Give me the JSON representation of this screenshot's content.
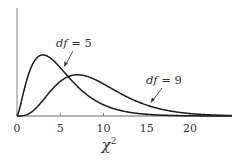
{
  "chart_data": {
    "type": "line",
    "title": "",
    "xlabel": "χ",
    "xlabel_superscript": "2",
    "ylabel": "",
    "xlim": [
      0,
      25
    ],
    "x_ticks": [
      0,
      5,
      10,
      15,
      20
    ],
    "x_tick_labels": [
      "0",
      "5",
      "10",
      "15",
      "20"
    ],
    "grid": false,
    "legend": "none",
    "series": [
      {
        "name": "df = 5",
        "df": 5,
        "description": "chi-square density, peak near χ² = 3"
      },
      {
        "name": "df = 9",
        "df": 9,
        "description": "chi-square density, peak near χ² = 7"
      }
    ],
    "annotations": [
      {
        "text_prefix": "df",
        "text_suffix": " = 5",
        "points_to_series": "df = 5"
      },
      {
        "text_prefix": "df",
        "text_suffix": " = 9",
        "points_to_series": "df = 9"
      }
    ]
  },
  "style": {
    "line_color": "#1a1a1a",
    "axis_color": "#666666",
    "text_color": "#333333"
  }
}
